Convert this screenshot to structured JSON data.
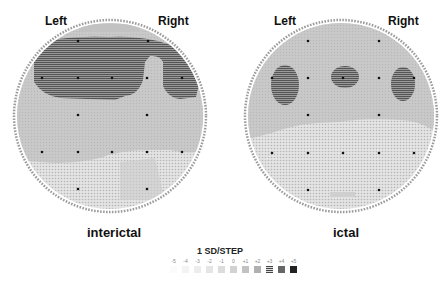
{
  "maps": [
    {
      "id": "interictal",
      "label_left": "Left",
      "label_right": "Right",
      "caption": "interictal"
    },
    {
      "id": "ictal",
      "label_left": "Left",
      "label_right": "Right",
      "caption": "ictal"
    }
  ],
  "legend": {
    "title": "1 SD/STEP",
    "steps": [
      "-5",
      "-4",
      "-3",
      "-2",
      "-1",
      "0",
      "+1",
      "+2",
      "+3",
      "+4",
      "+5"
    ],
    "colors": [
      "#fbfbfb",
      "#f4f4f4",
      "#eeeeee",
      "#e6e6e6",
      "#dddddd",
      "#d3d3d3",
      "#c4c4c4",
      "#b3b3b3",
      "#8a8a8a",
      "#666666",
      "#2a2a2a"
    ]
  },
  "colors": {
    "level_plus3": "#8c8c8c",
    "level_plus1": "#b8b8b8",
    "level_0": "#cfcfcf",
    "level_minus1": "#dcdcdc",
    "electrode": "#111111"
  }
}
